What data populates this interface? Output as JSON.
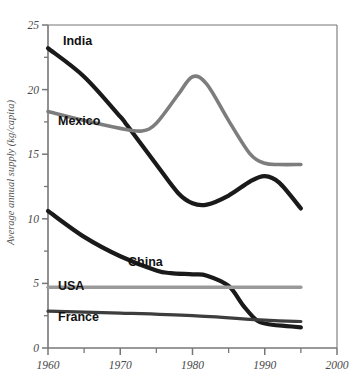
{
  "chart_data": {
    "type": "line",
    "title": "",
    "xlabel": "",
    "ylabel": "Average annual supply (kg/capita)",
    "xlim": [
      1960,
      2000
    ],
    "ylim": [
      0,
      25
    ],
    "xticks": [
      1960,
      1970,
      1980,
      1990,
      2000
    ],
    "xtick_labels": [
      "1960",
      "1970",
      "1980",
      "1990",
      "2000"
    ],
    "xminorticks": [
      1965,
      1975,
      1985,
      1995
    ],
    "yticks": [
      0,
      5,
      10,
      15,
      20,
      25
    ],
    "ytick_labels": [
      "0",
      "5",
      "10",
      "15",
      "20",
      "25"
    ],
    "yminorticks": [
      2.5,
      7.5,
      12.5,
      17.5,
      22.5
    ],
    "grid": false,
    "legend": "inline-labels",
    "series": [
      {
        "name": "India",
        "label": "India",
        "color": "#1a1a1a",
        "width": 4.2,
        "x": [
          1960,
          1965,
          1970,
          1971,
          1975,
          1978,
          1980,
          1982,
          1985,
          1988,
          1990,
          1992,
          1995
        ],
        "y": [
          23.2,
          21.0,
          17.9,
          17.2,
          14.2,
          12.0,
          11.2,
          11.1,
          11.8,
          12.9,
          13.3,
          12.8,
          10.8
        ]
      },
      {
        "name": "Mexico",
        "label": "Mexico",
        "color": "#7d7d7d",
        "width": 3.6,
        "x": [
          1960,
          1965,
          1970,
          1973,
          1975,
          1978,
          1980,
          1982,
          1985,
          1988,
          1990,
          1992,
          1995
        ],
        "y": [
          18.3,
          17.6,
          17.0,
          16.8,
          17.4,
          19.6,
          21.0,
          20.4,
          17.6,
          15.0,
          14.3,
          14.2,
          14.2
        ]
      },
      {
        "name": "China",
        "label": "China",
        "color": "#1a1a1a",
        "width": 4.2,
        "x": [
          1960,
          1965,
          1970,
          1975,
          1977,
          1980,
          1982,
          1985,
          1987,
          1989,
          1991,
          1993,
          1995
        ],
        "y": [
          10.6,
          8.6,
          7.1,
          6.0,
          5.8,
          5.7,
          5.6,
          4.8,
          3.3,
          2.1,
          1.8,
          1.7,
          1.6
        ]
      },
      {
        "name": "USA",
        "label": "USA",
        "color": "#9a9a9a",
        "width": 3.4,
        "x": [
          1960,
          1995
        ],
        "y": [
          4.7,
          4.7
        ]
      },
      {
        "name": "France",
        "label": "France",
        "color": "#3d3d3d",
        "width": 3.2,
        "x": [
          1960,
          1970,
          1980,
          1990,
          1995
        ],
        "y": [
          2.85,
          2.7,
          2.5,
          2.15,
          2.05
        ]
      }
    ],
    "series_label_positions": [
      {
        "name": "India",
        "x": 63,
        "y": 45
      },
      {
        "name": "Mexico",
        "x": 58,
        "y": 125
      },
      {
        "name": "China",
        "x": 128,
        "y": 266
      },
      {
        "name": "USA",
        "x": 58,
        "y": 290
      },
      {
        "name": "France",
        "x": 58,
        "y": 321
      }
    ],
    "axis_color": "#777777",
    "background": "#ffffff"
  }
}
